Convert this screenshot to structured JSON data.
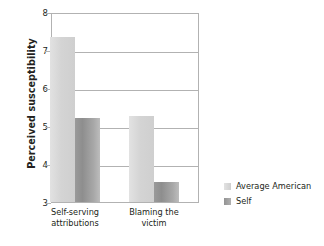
{
  "chart_data": {
    "type": "bar",
    "title": "",
    "xlabel": "",
    "ylabel": "Perceived susceptibility",
    "ylim": [
      3,
      8
    ],
    "yticks": [
      "8",
      "7",
      "6",
      "5",
      "4",
      "3"
    ],
    "grid": true,
    "legend_position": "bottom-right",
    "categories": [
      "Self-serving attributions",
      "Blaming the victim"
    ],
    "category_lines": [
      {
        "line1": "Self-serving",
        "line2": "attributions"
      },
      {
        "line1": "Blaming the",
        "line2": "victim"
      }
    ],
    "series": [
      {
        "name": "Average American",
        "color": "#d4d4d4",
        "values": [
          7.38,
          5.3
        ]
      },
      {
        "name": "Self",
        "color": "#949494",
        "values": [
          5.23,
          3.55
        ]
      }
    ]
  },
  "legend": {
    "items": [
      {
        "label": "Average American",
        "swatch": "light-gray-swatch"
      },
      {
        "label": "Self",
        "swatch": "dark-gray-swatch"
      }
    ]
  }
}
